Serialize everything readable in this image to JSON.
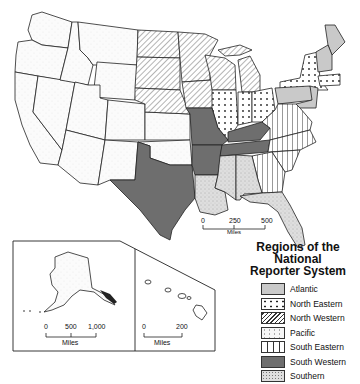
{
  "figure": {
    "caption_partial": "Figure … Regions of the National Reporter System",
    "main_map": {
      "scale_bar": {
        "ticks": [
          "0",
          "250",
          "500"
        ],
        "unit": "Miles"
      }
    },
    "alaska_inset": {
      "scale_bar": {
        "ticks": [
          "0",
          "500",
          "1,000"
        ],
        "unit": "Miles"
      }
    },
    "hawaii_inset": {
      "scale_bar": {
        "ticks": [
          "0",
          "200"
        ],
        "unit": "Miles"
      }
    },
    "legend": {
      "title_line1": "Regions of the National",
      "title_line2": "Reporter System",
      "items": [
        {
          "label": "Atlantic",
          "pattern": "light-gray-fill",
          "color": "#c8c8c8"
        },
        {
          "label": "North Eastern",
          "pattern": "dots",
          "color": "#ffffff"
        },
        {
          "label": "North Western",
          "pattern": "diagonal-hatch",
          "color": "#ffffff"
        },
        {
          "label": "Pacific",
          "pattern": "faint-stipple",
          "color": "#f4f4f4"
        },
        {
          "label": "South Eastern",
          "pattern": "vertical-lines",
          "color": "#ffffff"
        },
        {
          "label": "South Western",
          "pattern": "dark-gray-fill",
          "color": "#6e6e6e"
        },
        {
          "label": "Southern",
          "pattern": "light-stipple",
          "color": "#d9d9d9"
        }
      ]
    }
  }
}
